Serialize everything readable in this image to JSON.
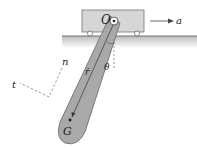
{
  "diagram": {
    "labels": {
      "pivot": "O",
      "acceleration": "a",
      "angle": "θ",
      "normal": "n",
      "tangent": "t",
      "position_vector": "r̄",
      "center_of_mass": "G"
    },
    "colors": {
      "cart": "#d4d4d4",
      "ground": "#cfcfcf",
      "pendulum": "#a8a8a8",
      "line": "#333333"
    }
  }
}
